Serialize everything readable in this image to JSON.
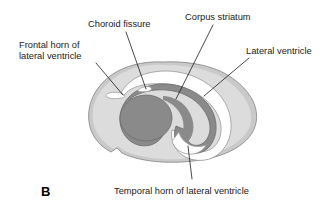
{
  "figure": {
    "panel_letter": "B",
    "caption_labels": {
      "choroid_fissure": "Choroid fissure",
      "corpus_striatum": "Corpus striatum",
      "lateral_ventricle": "Lateral ventricle",
      "frontal_horn_line1": "Frontal horn of",
      "frontal_horn_line2": "lateral ventricle",
      "temporal_horn": "Temporal horn of lateral ventricle"
    },
    "colors": {
      "background": "#ffffff",
      "brain_fill": "#d9d9d9",
      "brain_cortex_band": "#c4c4c4",
      "brain_outline": "#8d8d8d",
      "striatum_fill": "#8a8a8a",
      "striatum_outline": "#6f6f6f",
      "ventricle_fill": "#ffffff",
      "ventricle_outline": "#9a9a9a",
      "text": "#1a1a1a",
      "leader_line": "#1a1a1a"
    },
    "structures": [
      {
        "name": "cerebral hemisphere",
        "shade": "light gray"
      },
      {
        "name": "corpus striatum",
        "shade": "dark gray"
      },
      {
        "name": "lateral ventricle",
        "shade": "white"
      },
      {
        "name": "frontal horn of lateral ventricle",
        "shade": "white"
      },
      {
        "name": "temporal horn of lateral ventricle",
        "shade": "white"
      },
      {
        "name": "choroid fissure",
        "shade": "white slit"
      }
    ]
  }
}
